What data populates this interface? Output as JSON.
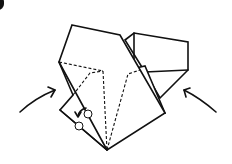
{
  "diagram": {
    "type": "origami-fold-step",
    "colors": {
      "line": "#111111",
      "paper": "#ffffff",
      "background": "#ffffff"
    },
    "arrows": [
      {
        "name": "push-arrow-left",
        "direction": "inward-up-right"
      },
      {
        "name": "push-arrow-right",
        "direction": "inward-up-left"
      },
      {
        "name": "rotate-arrow-small",
        "direction": "curl-down-left"
      }
    ],
    "markers": [
      {
        "name": "pivot-point-upper"
      },
      {
        "name": "pivot-point-lower"
      }
    ],
    "lines": {
      "solid": "fold-edges",
      "dashed": "hidden-edges"
    }
  }
}
